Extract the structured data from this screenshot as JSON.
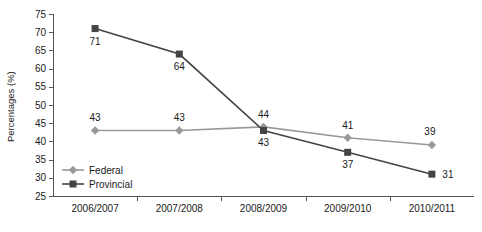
{
  "chart_data": {
    "type": "line",
    "title": "",
    "xlabel": "",
    "ylabel": "Percentages (%)",
    "categories": [
      "2006/2007",
      "2007/2008",
      "2008/2009",
      "2009/2010",
      "2010/2011"
    ],
    "series": [
      {
        "name": "Federal",
        "values": [
          43,
          43,
          44,
          41,
          39
        ],
        "color": "#999999",
        "marker": "diamond"
      },
      {
        "name": "Provincial",
        "values": [
          71,
          64,
          43,
          37,
          31
        ],
        "color": "#444444",
        "marker": "square"
      }
    ],
    "ylim": [
      25,
      75
    ],
    "yticks": [
      25,
      30,
      35,
      40,
      45,
      50,
      55,
      60,
      65,
      70,
      75
    ],
    "grid": false,
    "legend_position": "inside-bottom-left",
    "data_labels": true
  },
  "legend": {
    "items": [
      {
        "label": "Federal",
        "color": "#999999",
        "marker": "diamond"
      },
      {
        "label": "Provincial",
        "color": "#444444",
        "marker": "square"
      }
    ]
  }
}
